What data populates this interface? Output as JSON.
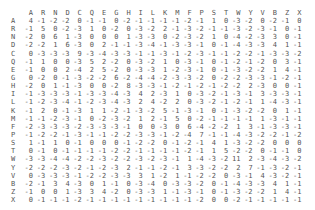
{
  "matrix": {
    "columns": [
      "A",
      "R",
      "N",
      "D",
      "C",
      "Q",
      "E",
      "G",
      "H",
      "I",
      "L",
      "K",
      "M",
      "F",
      "P",
      "S",
      "T",
      "W",
      "Y",
      "V",
      "B",
      "Z",
      "X"
    ],
    "rows": [
      {
        "label": "A",
        "values": [
          4,
          -1,
          -2,
          -2,
          0,
          -1,
          -1,
          0,
          -2,
          -1,
          -1,
          -1,
          -1,
          -2,
          -1,
          1,
          0,
          -3,
          -2,
          0,
          -2,
          -1,
          0
        ]
      },
      {
        "label": "R",
        "values": [
          -1,
          5,
          0,
          -2,
          -3,
          1,
          0,
          -2,
          0,
          -3,
          -2,
          2,
          -1,
          -3,
          -2,
          -1,
          -1,
          -3,
          -2,
          -3,
          -1,
          0,
          -1
        ]
      },
      {
        "label": "N",
        "values": [
          -2,
          0,
          6,
          1,
          -3,
          0,
          0,
          0,
          1,
          -3,
          -3,
          0,
          -2,
          -3,
          -2,
          1,
          0,
          -4,
          -2,
          -3,
          3,
          0,
          -1
        ]
      },
      {
        "label": "D",
        "values": [
          -2,
          -2,
          1,
          6,
          -3,
          0,
          2,
          -1,
          -1,
          -3,
          -4,
          -1,
          -3,
          -3,
          -1,
          0,
          -1,
          -4,
          -3,
          -3,
          4,
          1,
          -1
        ]
      },
      {
        "label": "C",
        "values": [
          0,
          -3,
          -3,
          -3,
          9,
          -3,
          -4,
          -3,
          -3,
          -1,
          -1,
          -3,
          -1,
          -2,
          -3,
          -1,
          -1,
          -2,
          -2,
          -1,
          -3,
          -3,
          -2
        ]
      },
      {
        "label": "Q",
        "values": [
          -1,
          1,
          0,
          0,
          -3,
          5,
          2,
          -2,
          0,
          -3,
          -2,
          1,
          0,
          -3,
          -1,
          0,
          -1,
          -2,
          -1,
          -2,
          0,
          3,
          -1
        ]
      },
      {
        "label": "E",
        "values": [
          -1,
          0,
          0,
          2,
          -4,
          2,
          5,
          -2,
          0,
          -3,
          -3,
          1,
          -2,
          -3,
          -1,
          0,
          -1,
          -3,
          -2,
          -2,
          1,
          4,
          -1
        ]
      },
      {
        "label": "G",
        "values": [
          0,
          -2,
          0,
          -1,
          -3,
          -2,
          -2,
          6,
          -2,
          -4,
          -4,
          -2,
          -3,
          -3,
          -2,
          0,
          -2,
          -2,
          -3,
          -3,
          -1,
          -2,
          -1
        ]
      },
      {
        "label": "H",
        "values": [
          -2,
          0,
          1,
          -1,
          -3,
          0,
          0,
          -2,
          8,
          -3,
          -3,
          -1,
          -2,
          -1,
          -2,
          -1,
          -2,
          -2,
          2,
          -3,
          0,
          0,
          -1
        ]
      },
      {
        "label": "I",
        "values": [
          -1,
          -3,
          -3,
          -3,
          -1,
          -3,
          -3,
          -4,
          -3,
          4,
          2,
          -3,
          1,
          0,
          -3,
          -2,
          -1,
          -3,
          -1,
          3,
          -3,
          -3,
          -1
        ]
      },
      {
        "label": "L",
        "values": [
          -1,
          -2,
          -3,
          -4,
          -1,
          -2,
          -3,
          -4,
          -3,
          2,
          4,
          -2,
          2,
          0,
          -3,
          -2,
          -1,
          -2,
          -1,
          1,
          -4,
          -3,
          -1
        ]
      },
      {
        "label": "K",
        "values": [
          -1,
          2,
          0,
          -1,
          -3,
          1,
          1,
          -2,
          -1,
          -3,
          -2,
          5,
          -1,
          -3,
          -1,
          0,
          -1,
          -3,
          -2,
          -2,
          0,
          1,
          -1
        ]
      },
      {
        "label": "M",
        "values": [
          -1,
          -1,
          -2,
          -3,
          -1,
          0,
          -2,
          -3,
          -2,
          1,
          2,
          -1,
          5,
          0,
          -2,
          -1,
          -1,
          -1,
          -1,
          1,
          -3,
          -1,
          -1
        ]
      },
      {
        "label": "F",
        "values": [
          -2,
          -3,
          -3,
          -3,
          -2,
          -3,
          -3,
          -3,
          -1,
          0,
          0,
          -3,
          0,
          6,
          -4,
          -2,
          -2,
          1,
          3,
          -1,
          -3,
          -3,
          -1
        ]
      },
      {
        "label": "P",
        "values": [
          -1,
          -2,
          -2,
          -1,
          -3,
          -1,
          -1,
          -2,
          -2,
          -3,
          -3,
          -1,
          -2,
          -4,
          7,
          -1,
          -1,
          -4,
          -3,
          -2,
          -2,
          -1,
          -2
        ]
      },
      {
        "label": "S",
        "values": [
          1,
          -1,
          1,
          0,
          -1,
          0,
          0,
          0,
          -1,
          -2,
          -2,
          0,
          -1,
          -2,
          -1,
          4,
          1,
          -3,
          -2,
          -2,
          0,
          0,
          0
        ]
      },
      {
        "label": "T",
        "values": [
          0,
          -1,
          0,
          -1,
          -1,
          -1,
          -1,
          -2,
          -2,
          -1,
          -1,
          -1,
          -1,
          -2,
          -1,
          1,
          5,
          -2,
          -2,
          0,
          -1,
          -1,
          0
        ]
      },
      {
        "label": "W",
        "values": [
          -3,
          -3,
          -4,
          -4,
          -2,
          -2,
          -3,
          -2,
          -2,
          -3,
          -2,
          -3,
          -1,
          1,
          -4,
          -3,
          -2,
          11,
          2,
          -3,
          -4,
          -3,
          -2
        ]
      },
      {
        "label": "Y",
        "values": [
          -2,
          -2,
          -2,
          -3,
          -2,
          -1,
          -2,
          -3,
          2,
          -1,
          -1,
          -2,
          -1,
          3,
          -3,
          -2,
          -2,
          2,
          7,
          -1,
          -3,
          -2,
          -1
        ]
      },
      {
        "label": "V",
        "values": [
          0,
          -3,
          -3,
          -3,
          -1,
          -2,
          -2,
          -3,
          -3,
          3,
          1,
          -2,
          1,
          -1,
          -2,
          -2,
          0,
          -3,
          -1,
          4,
          -3,
          -2,
          -1
        ]
      },
      {
        "label": "B",
        "values": [
          -2,
          -1,
          3,
          4,
          -3,
          0,
          1,
          -1,
          0,
          -3,
          -4,
          0,
          -3,
          -3,
          -2,
          0,
          -1,
          -4,
          -3,
          -3,
          4,
          1,
          -1
        ]
      },
      {
        "label": "Z",
        "values": [
          -1,
          0,
          0,
          1,
          -3,
          3,
          4,
          -2,
          0,
          -3,
          -3,
          1,
          -1,
          -3,
          -1,
          0,
          -1,
          -3,
          -2,
          -2,
          1,
          4,
          -1
        ]
      },
      {
        "label": "X",
        "values": [
          0,
          -1,
          -1,
          -1,
          -2,
          -1,
          -1,
          -1,
          -1,
          -1,
          -1,
          -1,
          -1,
          -1,
          -2,
          0,
          0,
          -2,
          -1,
          -1,
          -1,
          -1,
          -1
        ]
      }
    ]
  }
}
